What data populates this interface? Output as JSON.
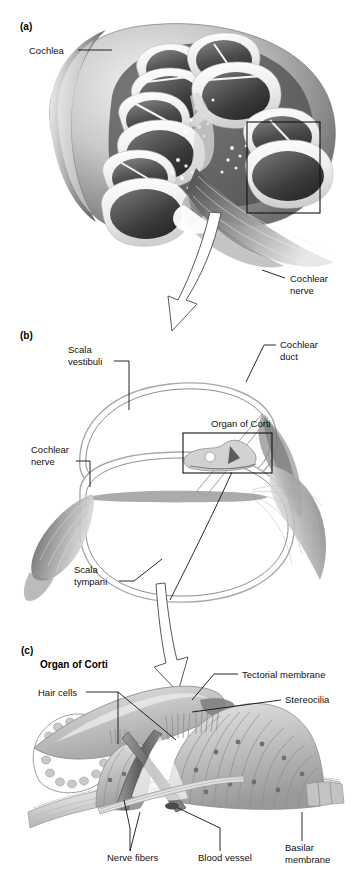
{
  "figure": {
    "background_color": "#ffffff",
    "ink_color": "#111111"
  },
  "panels": [
    {
      "id": "(a)",
      "name": "cochlea-cross-section",
      "labels": [
        {
          "name": "cochlea",
          "text": "Cochlea",
          "lines": [
            "Cochlea"
          ]
        },
        {
          "name": "cochlear-nerve",
          "text": "Cochlear nerve",
          "lines": [
            "Cochlear",
            "nerve"
          ]
        }
      ],
      "inset_box": {
        "x": 247,
        "y": 122,
        "w": 73,
        "h": 91
      }
    },
    {
      "id": "(b)",
      "name": "cochlear-duct-cross-section",
      "labels": [
        {
          "name": "scala-vestibuli",
          "text": "Scala vestibuli",
          "lines": [
            "Scala",
            "vestibuli"
          ]
        },
        {
          "name": "cochlear-duct",
          "text": "Cochlear duct",
          "lines": [
            "Cochlear",
            "duct"
          ]
        },
        {
          "name": "organ-of-corti",
          "text": "Organ of Corti",
          "lines": [
            "Organ of Corti"
          ]
        },
        {
          "name": "cochlear-nerve",
          "text": "Cochlear nerve",
          "lines": [
            "Cochlear",
            "nerve"
          ]
        },
        {
          "name": "scala-tympani",
          "text": "Scala tympani",
          "lines": [
            "Scala",
            "tympani"
          ]
        }
      ],
      "inset_box": {
        "x": 183,
        "y": 433,
        "w": 89,
        "h": 40
      }
    },
    {
      "id": "(c)",
      "name": "organ-of-corti-detail",
      "heading": "Organ of Corti",
      "labels": [
        {
          "name": "tectorial-membrane",
          "text": "Tectorial membrane",
          "lines": [
            "Tectorial membrane"
          ]
        },
        {
          "name": "stereocilia",
          "text": "Stereocilia",
          "lines": [
            "Stereocilia"
          ]
        },
        {
          "name": "hair-cells",
          "text": "Hair cells",
          "lines": [
            "Hair cells"
          ]
        },
        {
          "name": "nerve-fibers",
          "text": "Nerve fibers",
          "lines": [
            "Nerve fibers"
          ]
        },
        {
          "name": "blood-vessel",
          "text": "Blood vessel",
          "lines": [
            "Blood vessel"
          ]
        },
        {
          "name": "basilar-membrane",
          "text": "Basilar membrane",
          "lines": [
            "Basilar",
            "membrane"
          ]
        }
      ]
    }
  ],
  "text": {
    "panel_a_id": "(a)",
    "panel_b_id": "(b)",
    "panel_c_id": "(c)",
    "cochlea": "Cochlea",
    "cochlear_nerve_l1": "Cochlear",
    "cochlear_nerve_l2": "nerve",
    "scala_vestibuli_l1": "Scala",
    "scala_vestibuli_l2": "vestibuli",
    "cochlear_duct_l1": "Cochlear",
    "cochlear_duct_l2": "duct",
    "organ_of_corti_b": "Organ of Corti",
    "cochlear_nerve_b_l1": "Cochlear",
    "cochlear_nerve_b_l2": "nerve",
    "scala_tympani_l1": "Scala",
    "scala_tympani_l2": "tympani",
    "organ_of_corti_c": "Organ of Corti",
    "tectorial_membrane": "Tectorial membrane",
    "stereocilia": "Stereocilia",
    "hair_cells": "Hair cells",
    "nerve_fibers": "Nerve fibers",
    "blood_vessel": "Blood vessel",
    "basilar_membrane_l1": "Basilar",
    "basilar_membrane_l2": "membrane"
  }
}
